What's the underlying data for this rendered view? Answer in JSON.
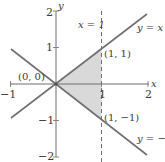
{
  "diagram": {
    "type": "region-plot",
    "colors": {
      "axis": "#6e6e6e",
      "line": "#707070",
      "dashed": "#707070",
      "shade": "#d9d9d9",
      "text": "#3a3a3a"
    },
    "axes": {
      "x_label": "x",
      "y_label": "y",
      "x_range": [
        -1,
        2
      ],
      "y_range": [
        -2,
        2
      ],
      "x_ticks": [
        {
          "value": -1,
          "label": "−1"
        },
        {
          "value": 1,
          "label": "1"
        },
        {
          "value": 2,
          "label": "2"
        }
      ],
      "y_ticks": [
        {
          "value": 2,
          "label": "2"
        },
        {
          "value": 1,
          "label": "1"
        },
        {
          "value": -1,
          "label": "−1"
        },
        {
          "value": -2,
          "label": "−2"
        }
      ]
    },
    "lines": [
      {
        "id": "y-equals-x",
        "label": "y = x"
      },
      {
        "id": "y-equals-neg-x",
        "label": "y = −x"
      },
      {
        "id": "x-equals-1",
        "label": "x = 1",
        "style": "dashed"
      }
    ],
    "points": [
      {
        "label": "(0, 0)"
      },
      {
        "label": "(1, 1)"
      },
      {
        "label": "(1, −1)"
      }
    ],
    "region": {
      "description": "triangle bounded by y = x, y = −x and x = 1",
      "vertices": [
        "(0, 0)",
        "(1, 1)",
        "(1, −1)"
      ]
    }
  }
}
